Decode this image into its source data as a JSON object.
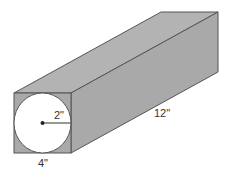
{
  "diagram": {
    "type": "3d-rectangular-prism-with-inscribed-circle",
    "labels": {
      "radius": "2\"",
      "length": "12\"",
      "width": "4\""
    },
    "colors": {
      "prism_face": "#a9a9a9",
      "prism_top": "#b3b3b3",
      "edge": "#555555",
      "circle_fill": "#ffffff",
      "background": "#ffffff"
    }
  }
}
